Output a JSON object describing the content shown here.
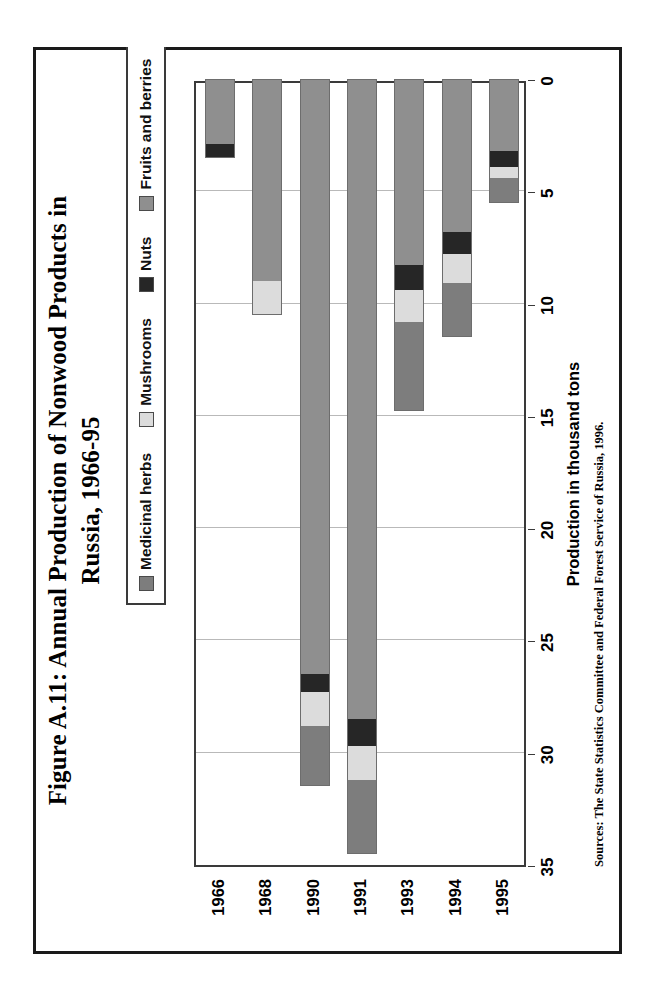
{
  "figure": {
    "title_line1": "Figure A.11: Annual Production of Nonwood Products in",
    "title_line2": "Russia, 1966-95",
    "source_note": "Sources: The State Statistics Committee and Federal Forest Service of Russia, 1996.",
    "page_border_color": "#1a1a1a"
  },
  "legend": {
    "position": "top-center",
    "items": [
      {
        "label": "Medicinal herbs",
        "color": "#7d7d7d"
      },
      {
        "label": "Mushrooms",
        "color": "#dcdcdc"
      },
      {
        "label": "Nuts",
        "color": "#262626"
      },
      {
        "label": "Fruits and berries",
        "color": "#8f8f8f"
      }
    ]
  },
  "chart_data": {
    "type": "bar",
    "orientation": "horizontal-stacked",
    "title": "Figure A.11: Annual Production of Nonwood Products in Russia, 1966-95",
    "xlabel": "",
    "ylabel": "Production in thousand tons",
    "value_axis_title": "Production in thousand tons",
    "value_axis_ticks": [
      35,
      30,
      25,
      20,
      15,
      10,
      5,
      0
    ],
    "value_axis_range": [
      0,
      35
    ],
    "value_axis_reversed": true,
    "grid": true,
    "legend_position": "top-center",
    "categories": [
      "1966",
      "1968",
      "1990",
      "1991",
      "1993",
      "1994",
      "1995"
    ],
    "series": [
      {
        "name": "Medicinal herbs",
        "color": "#7d7d7d",
        "values": [
          0.0,
          0.0,
          2.7,
          3.3,
          4.0,
          2.4,
          1.1
        ]
      },
      {
        "name": "Mushrooms",
        "color": "#dcdcdc",
        "values": [
          0.0,
          1.5,
          1.5,
          1.5,
          1.4,
          1.3,
          0.5
        ]
      },
      {
        "name": "Nuts",
        "color": "#262626",
        "values": [
          0.6,
          0.0,
          0.8,
          1.2,
          1.1,
          1.0,
          0.7
        ]
      },
      {
        "name": "Fruits and berries",
        "color": "#8f8f8f",
        "values": [
          2.9,
          9.0,
          26.5,
          28.5,
          8.3,
          6.8,
          3.2
        ]
      }
    ],
    "totals": [
      3.5,
      10.5,
      31.5,
      34.5,
      14.8,
      11.5,
      5.5
    ]
  }
}
